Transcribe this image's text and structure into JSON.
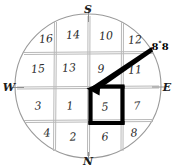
{
  "diagram": {
    "type": "compass-grid",
    "background_color": "#ffffff",
    "ink_color": "#2a2a2a",
    "grid_line_color": "#b8b8b8",
    "circle_color": "#9a9a9a",
    "bold_color": "#000000"
  },
  "compass": {
    "top_label": "S",
    "bottom_label": "N",
    "left_label": "W",
    "right_label": "E"
  },
  "annotation": {
    "angle_value": "8",
    "degree_symbol": "°",
    "angle_suffix": "8",
    "full_text": "8°8"
  },
  "grid": {
    "rows": 4,
    "cols": 4,
    "cells": [
      [
        {
          "label": "16",
          "x": 46,
          "y": 39
        },
        {
          "label": "14",
          "x": 73,
          "y": 35
        },
        {
          "label": "10",
          "x": 106,
          "y": 36
        },
        {
          "label": "12",
          "x": 135,
          "y": 40
        }
      ],
      [
        {
          "label": "15",
          "x": 38,
          "y": 69
        },
        {
          "label": "13",
          "x": 69,
          "y": 68
        },
        {
          "label": "9",
          "x": 101,
          "y": 69
        },
        {
          "label": "11",
          "x": 135,
          "y": 70
        }
      ],
      [
        {
          "label": "3",
          "x": 38,
          "y": 106
        },
        {
          "label": "1",
          "x": 70,
          "y": 106
        },
        {
          "label": "5",
          "x": 105,
          "y": 107
        },
        {
          "label": "7",
          "x": 137,
          "y": 106
        }
      ],
      [
        {
          "label": "4",
          "x": 47,
          "y": 133
        },
        {
          "label": "2",
          "x": 73,
          "y": 137
        },
        {
          "label": "6",
          "x": 105,
          "y": 137
        },
        {
          "label": "8",
          "x": 134,
          "y": 133
        }
      ]
    ]
  },
  "highlight": {
    "highlighted_cell": "5",
    "description": "bold square outline around cell 5"
  },
  "arrow": {
    "from_x": 150,
    "from_y": 49,
    "to_x": 89,
    "to_y": 88,
    "description": "bold arrow pointing to top-left corner of cell 5"
  }
}
